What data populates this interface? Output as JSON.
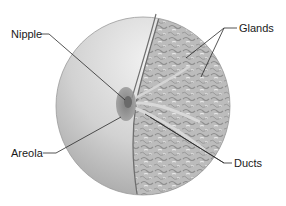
{
  "diagram": {
    "labels": {
      "nipple": "Nipple",
      "glands": "Glands",
      "areola": "Areola",
      "ducts": "Ducts"
    },
    "colors": {
      "skin_light": "#e6e6e6",
      "skin_dark": "#a8a8a8",
      "glands": "#bdbdbd",
      "gland_texture_light": "#e8e8e8",
      "gland_texture_dark": "#8f8f8f",
      "areola": "#8a8a8a",
      "leader_line": "#2a2a2a",
      "outline": "#7a7a7a"
    }
  }
}
